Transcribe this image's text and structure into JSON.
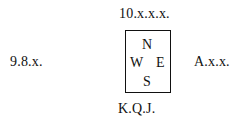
{
  "diagram": {
    "type": "bridge-hand-layout",
    "hands": {
      "north": "10.x.x.x.",
      "west": "9.8.x.",
      "east": "A.x.x.",
      "south": "K.Q.J."
    },
    "compass": {
      "n": "N",
      "w": "W",
      "e": "E",
      "s": "S"
    },
    "colors": {
      "text": "#111111",
      "border": "#111111",
      "background": "#ffffff"
    }
  }
}
